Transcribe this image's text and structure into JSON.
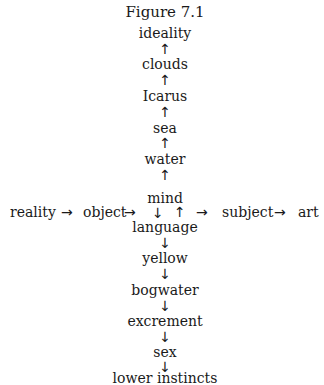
{
  "figure": {
    "title": "Figure 7.1"
  },
  "upward_chain": [
    {
      "label": "ideality"
    },
    {
      "label": "clouds"
    },
    {
      "label": "Icarus"
    },
    {
      "label": "sea"
    },
    {
      "label": "water"
    }
  ],
  "center": {
    "label": "mind",
    "down_arrow": "↓",
    "up_arrow": "↑"
  },
  "horizontal_chain": {
    "items": [
      {
        "label": "reality"
      },
      {
        "label": "object"
      },
      {
        "label": "subject"
      },
      {
        "label": "art"
      }
    ],
    "arrow": "→"
  },
  "downward_chain": [
    {
      "label": "language"
    },
    {
      "label": "yellow"
    },
    {
      "label": "bogwater"
    },
    {
      "label": "excrement"
    },
    {
      "label": "sex"
    },
    {
      "label": "lower instincts"
    }
  ],
  "arrows": {
    "up": "↑",
    "down": "↓",
    "right": "→"
  }
}
